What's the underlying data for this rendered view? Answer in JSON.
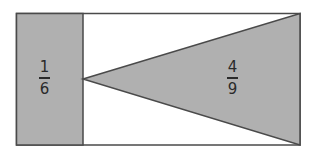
{
  "diagram": {
    "colors": {
      "fill": "#b0b0b0",
      "stroke": "#4a4a4a",
      "background": "#ffffff"
    },
    "outer_rectangle": {
      "x": 16,
      "y": 13,
      "width": 284,
      "height": 132
    },
    "shaded_strip": {
      "x": 16,
      "y": 13,
      "width": 67,
      "height": 132,
      "label": {
        "numerator": "1",
        "denominator": "6"
      }
    },
    "shaded_triangle": {
      "points": [
        [
          83,
          79
        ],
        [
          300,
          13
        ],
        [
          300,
          145
        ]
      ],
      "label": {
        "numerator": "4",
        "denominator": "9"
      }
    }
  }
}
